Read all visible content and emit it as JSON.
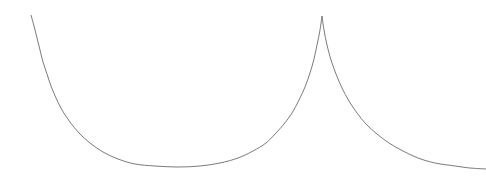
{
  "figure": {
    "width": 486,
    "height": 185,
    "background_color": "#ffffff",
    "title": "",
    "subtitle": ""
  },
  "chart_data": {
    "type": "line",
    "title": "",
    "subtitle": "",
    "xlabel": "",
    "ylabel": "",
    "xlim": [
      0,
      486
    ],
    "ylim": [
      185,
      0
    ],
    "grid": false,
    "axes_visible": false,
    "tick_labels_x": [],
    "tick_labels_y": [],
    "legend": [],
    "legend_position": "none",
    "annotations": [],
    "series": [
      {
        "name": "cycloid-curve",
        "color": "#595959",
        "line_width": 0.8,
        "style": "solid",
        "cusps": [
          {
            "x": 322,
            "y": 16
          }
        ],
        "minima": [
          {
            "x": 178,
            "y": 167
          }
        ],
        "endpoints": [
          {
            "x": 31,
            "y": 15
          },
          {
            "x": 486,
            "y": 169
          }
        ],
        "points": [
          {
            "x": 31,
            "y": 15
          },
          {
            "x": 34,
            "y": 26
          },
          {
            "x": 37,
            "y": 38
          },
          {
            "x": 40,
            "y": 50
          },
          {
            "x": 43,
            "y": 62
          },
          {
            "x": 47,
            "y": 74
          },
          {
            "x": 51,
            "y": 86
          },
          {
            "x": 56,
            "y": 98
          },
          {
            "x": 62,
            "y": 110
          },
          {
            "x": 70,
            "y": 122
          },
          {
            "x": 79,
            "y": 133
          },
          {
            "x": 90,
            "y": 143
          },
          {
            "x": 103,
            "y": 152
          },
          {
            "x": 118,
            "y": 159
          },
          {
            "x": 135,
            "y": 164
          },
          {
            "x": 155,
            "y": 166
          },
          {
            "x": 178,
            "y": 167
          },
          {
            "x": 200,
            "y": 166
          },
          {
            "x": 220,
            "y": 163
          },
          {
            "x": 238,
            "y": 158
          },
          {
            "x": 253,
            "y": 151
          },
          {
            "x": 266,
            "y": 143
          },
          {
            "x": 275,
            "y": 134
          },
          {
            "x": 284,
            "y": 124
          },
          {
            "x": 292,
            "y": 113
          },
          {
            "x": 299,
            "y": 100
          },
          {
            "x": 305,
            "y": 87
          },
          {
            "x": 310,
            "y": 73
          },
          {
            "x": 314,
            "y": 59
          },
          {
            "x": 317,
            "y": 45
          },
          {
            "x": 320,
            "y": 30
          },
          {
            "x": 322,
            "y": 16
          },
          {
            "x": 324,
            "y": 30
          },
          {
            "x": 327,
            "y": 45
          },
          {
            "x": 331,
            "y": 60
          },
          {
            "x": 336,
            "y": 74
          },
          {
            "x": 342,
            "y": 88
          },
          {
            "x": 349,
            "y": 101
          },
          {
            "x": 357,
            "y": 113
          },
          {
            "x": 366,
            "y": 124
          },
          {
            "x": 377,
            "y": 134
          },
          {
            "x": 389,
            "y": 143
          },
          {
            "x": 403,
            "y": 151
          },
          {
            "x": 418,
            "y": 158
          },
          {
            "x": 435,
            "y": 163
          },
          {
            "x": 455,
            "y": 166
          },
          {
            "x": 470,
            "y": 168
          },
          {
            "x": 486,
            "y": 169
          }
        ]
      }
    ]
  }
}
